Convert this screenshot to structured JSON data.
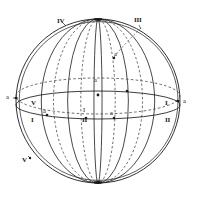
{
  "figure": {
    "background_color": "#ffffff",
    "stroke_color": "#1a1a1a",
    "dash_color": "#3a3a3a"
  },
  "labels": {
    "roman": [
      {
        "id": "roman-iv-top-left",
        "text": "IV",
        "x": 57,
        "y": 18
      },
      {
        "id": "roman-iii-top-right",
        "text": "III",
        "x": 134,
        "y": 17
      },
      {
        "id": "roman-v-left-mid",
        "text": "V",
        "x": 31,
        "y": 100
      },
      {
        "id": "roman-i-left-lower",
        "text": "I",
        "x": 31,
        "y": 117
      },
      {
        "id": "roman-i-right",
        "text": "I",
        "x": 165,
        "y": 100
      },
      {
        "id": "roman-ii-right",
        "text": "II",
        "x": 165,
        "y": 117
      },
      {
        "id": "roman-ii-center",
        "text": "II",
        "x": 82,
        "y": 117
      },
      {
        "id": "roman-v-lower-left",
        "text": "V",
        "x": 22,
        "y": 157
      }
    ],
    "points": [
      {
        "id": "point-a-left-edge",
        "text": "a",
        "x": 6,
        "y": 97
      },
      {
        "id": "point-a-right-edge",
        "text": "a",
        "x": 181,
        "y": 102
      },
      {
        "id": "point-a-center-upper",
        "text": "a",
        "x": 94,
        "y": 77
      },
      {
        "id": "point-a-left-band",
        "text": "a",
        "x": 43,
        "y": 110
      },
      {
        "id": "point-a-right-band",
        "text": "a",
        "x": 110,
        "y": 113
      },
      {
        "id": "point-a-upper-right",
        "text": "a",
        "x": 113,
        "y": 55
      },
      {
        "id": "point-i-center",
        "text": "I",
        "x": 83,
        "y": 109
      }
    ]
  },
  "geometry": {
    "sphere": {
      "cx": 98,
      "cy": 101,
      "r": 82
    },
    "poles": {
      "north_y": 20,
      "south_y": 182
    },
    "equator_dashed": {
      "cx": 98,
      "cy": 96,
      "rx": 82,
      "ry": 18
    },
    "equator_solid": {
      "cx": 98,
      "cy": 105,
      "rx": 82,
      "ry": 14
    },
    "meridians_solid_rx": [
      82,
      56,
      30,
      2
    ],
    "meridians_dashed_rx": [
      44,
      18
    ],
    "marker_dots": 9
  }
}
